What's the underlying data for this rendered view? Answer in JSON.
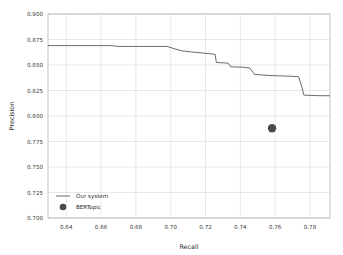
{
  "chart_data": {
    "type": "line",
    "title": "",
    "xlabel": "Recall",
    "ylabel": "Precision",
    "xlim": [
      0.6295,
      0.7915
    ],
    "ylim": [
      0.7,
      0.9
    ],
    "xticks": [
      0.64,
      0.66,
      0.68,
      0.7,
      0.72,
      0.74,
      0.76,
      0.78
    ],
    "xtick_labels": [
      "0.64",
      "0.66",
      "0.68",
      "0.70",
      "0.72",
      "0.74",
      "0.76",
      "0.78"
    ],
    "yticks": [
      0.7,
      0.725,
      0.75,
      0.775,
      0.8,
      0.825,
      0.85,
      0.875,
      0.9
    ],
    "ytick_labels": [
      "0.700",
      "0.725",
      "0.750",
      "0.775",
      "0.800",
      "0.825",
      "0.850",
      "0.875",
      "0.900"
    ],
    "grid": true,
    "grid_color": "#d9d9d9",
    "legend_position": "lower-left",
    "series": [
      {
        "name": "Our system",
        "kind": "line",
        "color": "#5a5a5a",
        "linewidth": 0.9,
        "points": [
          [
            0.6295,
            0.869
          ],
          [
            0.666,
            0.869
          ],
          [
            0.67,
            0.8682
          ],
          [
            0.698,
            0.8682
          ],
          [
            0.701,
            0.8665
          ],
          [
            0.706,
            0.864
          ],
          [
            0.712,
            0.8628
          ],
          [
            0.718,
            0.8618
          ],
          [
            0.7255,
            0.8605
          ],
          [
            0.7262,
            0.8525
          ],
          [
            0.733,
            0.8518
          ],
          [
            0.7345,
            0.8482
          ],
          [
            0.742,
            0.8478
          ],
          [
            0.7455,
            0.847
          ],
          [
            0.748,
            0.8408
          ],
          [
            0.753,
            0.8402
          ],
          [
            0.756,
            0.8398
          ],
          [
            0.76,
            0.8395
          ],
          [
            0.769,
            0.839
          ],
          [
            0.7735,
            0.8385
          ],
          [
            0.7755,
            0.8275
          ],
          [
            0.7765,
            0.8205
          ],
          [
            0.783,
            0.82
          ],
          [
            0.7915,
            0.8198
          ]
        ]
      },
      {
        "name": "BERTopic",
        "kind": "scatter",
        "color": "#4a4a4a",
        "marker": "circle",
        "marker_size": 4.2,
        "points": [
          [
            0.7582,
            0.788
          ]
        ]
      }
    ]
  },
  "axes": {
    "xlabel": "Recall",
    "ylabel": "Precision"
  },
  "legend": {
    "items": [
      {
        "label": "Our system",
        "kind": "line",
        "color": "#5a5a5a"
      },
      {
        "label": "BERTopic",
        "kind": "marker",
        "color": "#4a4a4a"
      }
    ]
  },
  "colors": {
    "line": "#5a5a5a",
    "marker": "#4a4a4a",
    "grid": "#d9d9d9",
    "frame": "#b4b4b4",
    "text": "#2b2b2b",
    "background": "#ffffff"
  }
}
